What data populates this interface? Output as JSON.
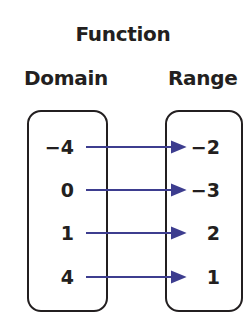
{
  "title": "Function",
  "domain_label": "Domain",
  "range_label": "Range",
  "arrow_color": "#3d3d8f",
  "mappings": [
    {
      "domain": "−4",
      "range": "−2"
    },
    {
      "domain": "0",
      "range": "−3"
    },
    {
      "domain": "1",
      "range": "2"
    },
    {
      "domain": "4",
      "range": "1"
    }
  ]
}
